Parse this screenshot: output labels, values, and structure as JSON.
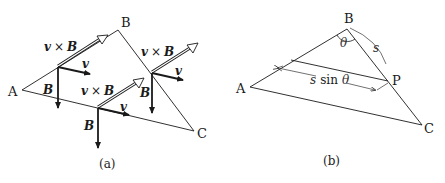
{
  "figure": {
    "panel_a": {
      "caption": "(a)",
      "vertices": {
        "A": "A",
        "B": "B",
        "C": "C"
      },
      "vector_labels": {
        "cross": [
          "v",
          "×",
          "B"
        ],
        "v": "v",
        "B": "B"
      },
      "points": [
        {
          "name": "on-AB",
          "cross_label": "v × B",
          "v_label": "v",
          "B_label": "B"
        },
        {
          "name": "on-AC",
          "cross_label": "v × B",
          "v_label": "v",
          "B_label": "B"
        },
        {
          "name": "on-BC",
          "cross_label": "v × B",
          "v_label": "v",
          "B_label": "B"
        }
      ]
    },
    "panel_b": {
      "caption": "(b)",
      "vertices": {
        "A": "A",
        "B": "B",
        "C": "C",
        "P": "P"
      },
      "angle_label": "θ",
      "arc_label": "s",
      "distance_label": {
        "s": "s",
        "sin": "sin",
        "theta": "θ"
      }
    },
    "colors": {
      "line": "#1a1a1a",
      "thin_line": "#333333",
      "background": "#ffffff"
    }
  }
}
